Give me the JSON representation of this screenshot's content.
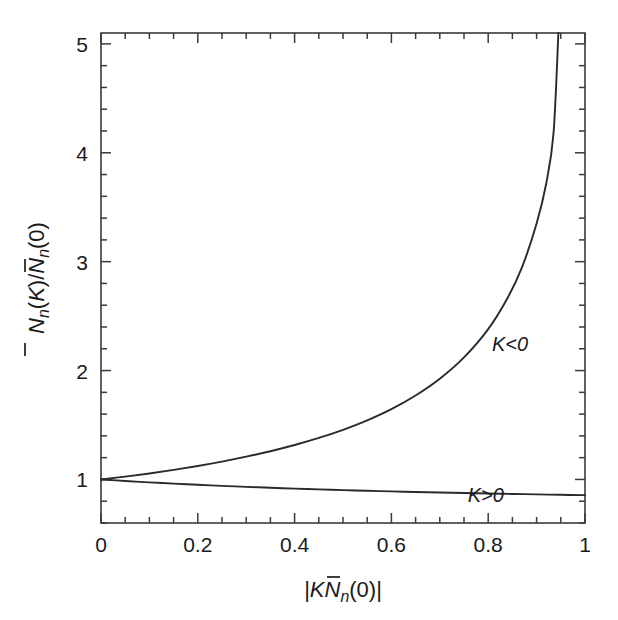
{
  "chart_data": {
    "type": "line",
    "title": "",
    "xlabel": "|K N̄ₙ(0)|",
    "ylabel": "N̄ₙ(K)/N̄ₙ(0)",
    "xlim": [
      0,
      1.0
    ],
    "ylim": [
      0.6,
      5.1
    ],
    "grid": false,
    "legend_position": "inline-annotation",
    "x_ticks_major": [
      "0",
      "0.2",
      "0.4",
      "0.6",
      "0.8",
      "1"
    ],
    "x_tick_values": [
      0,
      0.2,
      0.4,
      0.6,
      0.8,
      1
    ],
    "x_minor_step": 0.05,
    "y_ticks_major": [
      "1",
      "2",
      "3",
      "4",
      "5"
    ],
    "y_tick_values": [
      1,
      2,
      3,
      4,
      5
    ],
    "y_minor_step": 0.2,
    "series": [
      {
        "name": "K < 0",
        "label": "K<0",
        "label_x": 0.845,
        "label_y": 2.18,
        "x": [
          0.0,
          0.05,
          0.1,
          0.15,
          0.2,
          0.25,
          0.3,
          0.35,
          0.4,
          0.45,
          0.5,
          0.55,
          0.6,
          0.65,
          0.7,
          0.75,
          0.8,
          0.84,
          0.87,
          0.9,
          0.92,
          0.935,
          0.945
        ],
        "y": [
          1.0,
          1.026,
          1.055,
          1.088,
          1.124,
          1.164,
          1.209,
          1.259,
          1.316,
          1.381,
          1.456,
          1.543,
          1.646,
          1.771,
          1.925,
          2.121,
          2.381,
          2.667,
          2.95,
          3.35,
          3.72,
          4.18,
          5.1
        ]
      },
      {
        "name": "K > 0",
        "label": "K>0",
        "label_x": 0.795,
        "label_y": 0.795,
        "x": [
          0.0,
          0.05,
          0.1,
          0.15,
          0.2,
          0.25,
          0.3,
          0.35,
          0.4,
          0.45,
          0.5,
          0.55,
          0.6,
          0.65,
          0.7,
          0.75,
          0.8,
          0.85,
          0.9,
          0.95,
          1.0
        ],
        "y": [
          1.0,
          0.986,
          0.973,
          0.962,
          0.951,
          0.941,
          0.932,
          0.924,
          0.916,
          0.909,
          0.902,
          0.896,
          0.89,
          0.885,
          0.88,
          0.875,
          0.871,
          0.867,
          0.863,
          0.859,
          0.856
        ]
      }
    ]
  },
  "axis": {
    "y_label_parts": {
      "n1": "N",
      "sub1": "n",
      "arg1": "(K)",
      "slash": "/",
      "n2": "N",
      "sub2": "n",
      "arg2": "(0)"
    },
    "x_label_parts": {
      "open": "|",
      "k": "K",
      "n": "N",
      "sub": "n",
      "arg": "(0)",
      "close": "|"
    }
  },
  "colors": {
    "curve": "#2a2a2a",
    "frame": "#3a3a3a",
    "background": "#ffffff",
    "text": "#1a1a1a"
  }
}
